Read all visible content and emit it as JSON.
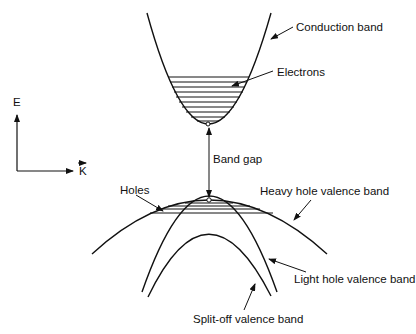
{
  "diagram": {
    "axes": {
      "y_label": "E",
      "x_label": "K"
    },
    "labels": {
      "conduction_band": "Conduction band",
      "electrons": "Electrons",
      "band_gap": "Band gap",
      "holes": "Holes",
      "heavy_hole": "Heavy hole valence band",
      "light_hole": "Light hole valence band",
      "split_off": "Split-off valence band"
    },
    "colors": {
      "line": "#111111",
      "background": "#ffffff"
    }
  }
}
